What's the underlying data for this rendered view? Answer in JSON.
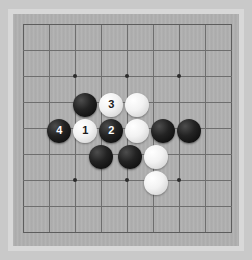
{
  "app": {
    "title": "Go Board",
    "background_color": "#c9c9c9",
    "frame_color": "#d8d8d8",
    "board_color": "#b0b0b0",
    "line_color": "#6e6e6e",
    "star_color": "#2b2b2b"
  },
  "board": {
    "size_label": "9x9 visible grid section",
    "columns": 9,
    "rows": 9,
    "cell_size": 26,
    "origin_x": 10,
    "origin_y": 10,
    "star_points": [
      {
        "col": 2,
        "row": 2
      },
      {
        "col": 4,
        "row": 2
      },
      {
        "col": 6,
        "row": 2
      },
      {
        "col": 2,
        "row": 6
      },
      {
        "col": 4,
        "row": 6
      },
      {
        "col": 6,
        "row": 6
      }
    ]
  },
  "stones": [
    {
      "id": "stone-black-a",
      "color": "black",
      "label": "",
      "col": 2.4,
      "row": 3.1
    },
    {
      "id": "stone-white-3",
      "color": "white",
      "label": "3",
      "col": 3.4,
      "row": 3.1
    },
    {
      "id": "stone-white-b",
      "color": "white",
      "label": "",
      "col": 4.4,
      "row": 3.1
    },
    {
      "id": "stone-black-4",
      "color": "black",
      "label": "4",
      "col": 1.4,
      "row": 4.1
    },
    {
      "id": "stone-white-1",
      "color": "white",
      "label": "1",
      "col": 2.4,
      "row": 4.1
    },
    {
      "id": "stone-black-2",
      "color": "black",
      "label": "2",
      "col": 3.4,
      "row": 4.1
    },
    {
      "id": "stone-white-c",
      "color": "white",
      "label": "",
      "col": 4.4,
      "row": 4.1
    },
    {
      "id": "stone-black-d",
      "color": "black",
      "label": "",
      "col": 5.4,
      "row": 4.1
    },
    {
      "id": "stone-black-e",
      "color": "black",
      "label": "",
      "col": 6.4,
      "row": 4.1
    },
    {
      "id": "stone-black-f",
      "color": "black",
      "label": "",
      "col": 3.0,
      "row": 5.1
    },
    {
      "id": "stone-black-g",
      "color": "black",
      "label": "",
      "col": 4.1,
      "row": 5.1
    },
    {
      "id": "stone-white-h",
      "color": "white",
      "label": "",
      "col": 5.1,
      "row": 5.1
    },
    {
      "id": "stone-white-i",
      "color": "white",
      "label": "",
      "col": 5.1,
      "row": 6.1
    }
  ],
  "move_numbers": {
    "1": "1",
    "2": "2",
    "3": "3",
    "4": "4"
  }
}
